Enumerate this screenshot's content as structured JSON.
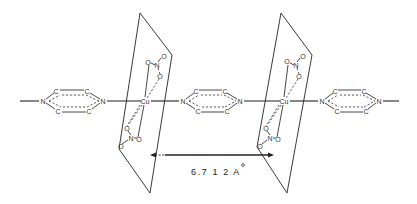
{
  "diagram": {
    "atom_labels": {
      "nitrogen": "N",
      "carbon": "C",
      "copper": "Cu",
      "oxygen": "O"
    },
    "distance": {
      "value": "6.712",
      "unit": "Å",
      "label": "6.7 1 2  A"
    },
    "rings": [
      {
        "id": "pyrazine-1",
        "n_left_x": 43,
        "n_right_x": 103
      },
      {
        "id": "pyrazine-2",
        "n_left_x": 183,
        "n_right_x": 240
      },
      {
        "id": "pyrazine-3",
        "n_left_x": 322,
        "n_right_x": 379
      }
    ],
    "planes": [
      {
        "id": "plane-1",
        "cu_x": 145
      },
      {
        "id": "plane-2",
        "cu_x": 284
      }
    ]
  }
}
